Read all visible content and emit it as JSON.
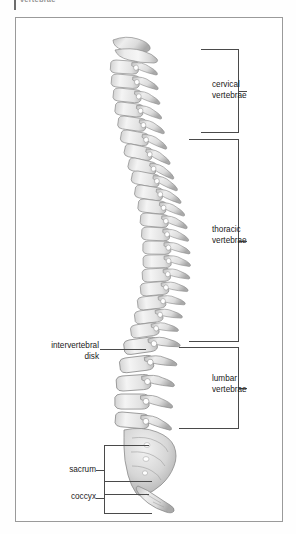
{
  "figure": {
    "top_caption_fragment": "vertebrae",
    "frame": {
      "border_color": "#9a9a9a",
      "background": "#ffffff"
    },
    "illustration": {
      "name": "human-vertebral-column-lateral-view",
      "orientation": "lateral (side) view, anterior to the left",
      "bone_fill": "#e9e9e9",
      "bone_shade": "#b9b9b9",
      "bone_outline": "#8b8b8b"
    },
    "labels": [
      {
        "id": "cervical",
        "text": "cervical\nvertebrae",
        "side": "right",
        "marker": "bracket"
      },
      {
        "id": "thoracic",
        "text": "thoracic\nvertebrae",
        "side": "right",
        "marker": "bracket"
      },
      {
        "id": "lumbar",
        "text": "lumbar\nvertebrae",
        "side": "right",
        "marker": "bracket"
      },
      {
        "id": "intervertebral",
        "text": "intervertebral\ndisk",
        "side": "left",
        "marker": "leader-line"
      },
      {
        "id": "sacrum",
        "text": "sacrum",
        "side": "left",
        "marker": "bracket"
      },
      {
        "id": "coccyx",
        "text": "coccyx",
        "side": "left",
        "marker": "bracket"
      }
    ]
  }
}
